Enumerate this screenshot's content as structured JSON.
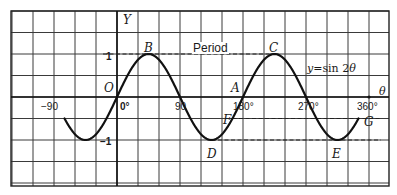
{
  "figure": {
    "type": "function-graph",
    "function_label": "y = sin 2θ",
    "function_label_parts": {
      "lhs": "y",
      "eq": "=",
      "rhs": "sin 2",
      "var": "θ"
    },
    "axes": {
      "x_label": "θ",
      "y_label": "Y",
      "origin_label": "O",
      "x_ticks": [
        {
          "value": -90,
          "label": "−90"
        },
        {
          "value": 0,
          "label": "0°"
        },
        {
          "value": 90,
          "label": "90"
        },
        {
          "value": 180,
          "label": "180°"
        },
        {
          "value": 270,
          "label": "270°"
        },
        {
          "value": 360,
          "label": "360°"
        }
      ],
      "y_ticks": [
        {
          "value": 1,
          "label": "1"
        },
        {
          "value": -1,
          "label": "−1"
        }
      ],
      "grid_step_deg": 30,
      "grid_step_y": 0.5
    },
    "points": [
      {
        "name": "A",
        "theta": 180,
        "y": 0
      },
      {
        "name": "B",
        "theta": 45,
        "y": 1
      },
      {
        "name": "C",
        "theta": 225,
        "y": 1
      },
      {
        "name": "D",
        "theta": 135,
        "y": -1
      },
      {
        "name": "E",
        "theta": 315,
        "y": -1
      },
      {
        "name": "F",
        "theta": 165,
        "y": -0.5
      },
      {
        "name": "G",
        "theta": 345,
        "y": -0.5
      }
    ],
    "annotations": {
      "period_label": "Period",
      "dashed_lines": [
        {
          "from": "B",
          "to": "C",
          "y": 1
        },
        {
          "from": "D",
          "to": "E",
          "y": -1
        },
        {
          "from": "F",
          "to": "G",
          "y": -0.5
        }
      ]
    },
    "curve_range_deg": [
      -75,
      345
    ],
    "colors": {
      "line": "#1a1a1a",
      "grid": "#333333",
      "background": "#ffffff"
    }
  }
}
